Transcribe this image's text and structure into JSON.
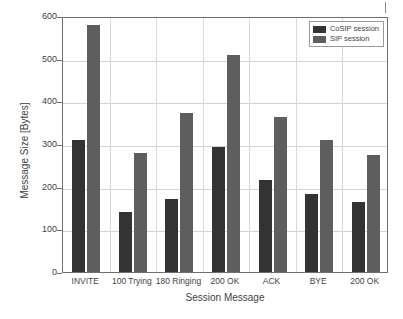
{
  "chart_data": {
    "type": "bar",
    "title": "",
    "xlabel": "Session Message",
    "ylabel": "Message Size [Bytes]",
    "categories": [
      "INVITE",
      "100 Trying",
      "180 Ringing",
      "200 OK",
      "ACK",
      "BYE",
      "200 OK"
    ],
    "series": [
      {
        "name": "CoSIP session",
        "color": "#333333",
        "values": [
          310,
          140,
          172,
          293,
          215,
          183,
          163
        ]
      },
      {
        "name": "SIP session",
        "color": "#5e5e5e",
        "values": [
          580,
          278,
          373,
          508,
          364,
          310,
          274
        ]
      }
    ],
    "ylim": [
      0,
      600
    ],
    "yticks": [
      0,
      100,
      200,
      300,
      400,
      500,
      600
    ],
    "ytick_labels": [
      "0",
      "100",
      "200",
      "300",
      "400",
      "500",
      "600"
    ],
    "grid": true,
    "legend_position": "top-right"
  },
  "legend": {
    "entries": [
      {
        "label": "CoSIP session"
      },
      {
        "label": "SIP session"
      }
    ]
  },
  "axes": {
    "y_title": "Message Size [Bytes]",
    "x_title": "Session Message"
  }
}
